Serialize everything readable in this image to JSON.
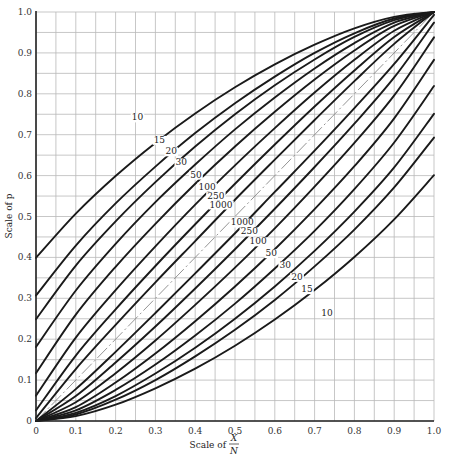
{
  "chart_data": {
    "type": "line",
    "title": "",
    "xlabel": "Scale of X/N",
    "xlabel_prefix": "Scale of",
    "xlabel_numerator": "X",
    "xlabel_denominator": "N",
    "ylabel": "Scale of p",
    "xlim": [
      0,
      1
    ],
    "ylim": [
      0,
      1
    ],
    "grid": true,
    "grid_step": 0.05,
    "x_ticks": [
      "0",
      "0.1",
      "0.2",
      "0.3",
      "0.4",
      "0.5",
      "0.6",
      "0.7",
      "0.8",
      "0.9",
      "1.0"
    ],
    "y_ticks": [
      "0",
      "0.1",
      "0.2",
      "0.3",
      "0.4",
      "0.5",
      "0.6",
      "0.7",
      "0.8",
      "0.9",
      "1.0"
    ],
    "reference_line": {
      "name": "diagonal p = X/N",
      "style": "dash-dot",
      "points": [
        [
          0,
          0
        ],
        [
          1,
          1
        ]
      ]
    },
    "x": [
      0,
      0.1,
      0.2,
      0.3,
      0.4,
      0.5,
      0.6,
      0.7,
      0.8,
      0.9,
      1.0
    ],
    "series": [
      {
        "name": "10",
        "band": "upper",
        "values": [
          0.399,
          0.507,
          0.599,
          0.68,
          0.752,
          0.816,
          0.872,
          0.92,
          0.96,
          0.988,
          1.0
        ]
      },
      {
        "name": "15",
        "band": "upper",
        "values": [
          0.307,
          0.429,
          0.532,
          0.622,
          0.704,
          0.777,
          0.842,
          0.9,
          0.948,
          0.984,
          1.0
        ]
      },
      {
        "name": "20",
        "band": "upper",
        "values": [
          0.249,
          0.38,
          0.488,
          0.584,
          0.671,
          0.75,
          0.821,
          0.884,
          0.939,
          0.98,
          1.0
        ]
      },
      {
        "name": "30",
        "band": "upper",
        "values": [
          0.181,
          0.319,
          0.433,
          0.535,
          0.627,
          0.713,
          0.791,
          0.862,
          0.924,
          0.974,
          1.0
        ]
      },
      {
        "name": "50",
        "band": "upper",
        "values": [
          0.117,
          0.26,
          0.377,
          0.482,
          0.58,
          0.671,
          0.756,
          0.835,
          0.906,
          0.966,
          1.0
        ]
      },
      {
        "name": "100",
        "band": "upper",
        "values": [
          0.062,
          0.204,
          0.32,
          0.427,
          0.529,
          0.625,
          0.716,
          0.803,
          0.883,
          0.954,
          1.0
        ]
      },
      {
        "name": "250",
        "band": "upper",
        "values": [
          0.026,
          0.16,
          0.273,
          0.379,
          0.481,
          0.58,
          0.676,
          0.769,
          0.857,
          0.939,
          1.0
        ]
      },
      {
        "name": "1000",
        "band": "upper",
        "values": [
          0.007,
          0.127,
          0.235,
          0.339,
          0.44,
          0.541,
          0.639,
          0.736,
          0.831,
          0.922,
          1.0
        ]
      },
      {
        "name": "10",
        "band": "lower",
        "values": [
          0.0,
          0.012,
          0.04,
          0.08,
          0.128,
          0.184,
          0.248,
          0.32,
          0.401,
          0.493,
          0.601
        ]
      },
      {
        "name": "15",
        "band": "lower",
        "values": [
          0.0,
          0.016,
          0.052,
          0.1,
          0.158,
          0.223,
          0.296,
          0.378,
          0.468,
          0.571,
          0.693
        ]
      },
      {
        "name": "20",
        "band": "lower",
        "values": [
          0.0,
          0.02,
          0.061,
          0.116,
          0.179,
          0.25,
          0.329,
          0.416,
          0.512,
          0.62,
          0.751
        ]
      },
      {
        "name": "30",
        "band": "lower",
        "values": [
          0.0,
          0.026,
          0.076,
          0.138,
          0.209,
          0.287,
          0.373,
          0.465,
          0.567,
          0.681,
          0.819
        ]
      },
      {
        "name": "50",
        "band": "lower",
        "values": [
          0.0,
          0.034,
          0.094,
          0.165,
          0.244,
          0.329,
          0.42,
          0.518,
          0.623,
          0.74,
          0.883
        ]
      },
      {
        "name": "100",
        "band": "lower",
        "values": [
          0.0,
          0.046,
          0.117,
          0.197,
          0.284,
          0.375,
          0.471,
          0.573,
          0.68,
          0.796,
          0.938
        ]
      },
      {
        "name": "250",
        "band": "lower",
        "values": [
          0.0,
          0.061,
          0.143,
          0.231,
          0.324,
          0.42,
          0.519,
          0.621,
          0.727,
          0.84,
          0.974
        ]
      },
      {
        "name": "1000",
        "band": "lower",
        "values": [
          0.0,
          0.078,
          0.169,
          0.264,
          0.361,
          0.459,
          0.56,
          0.661,
          0.765,
          0.873,
          0.993
        ]
      }
    ],
    "curve_labels": {
      "upper": [
        {
          "text": "10",
          "x": 0.255,
          "y": 0.735
        },
        {
          "text": "15",
          "x": 0.31,
          "y": 0.68
        },
        {
          "text": "20",
          "x": 0.34,
          "y": 0.652
        },
        {
          "text": "30",
          "x": 0.365,
          "y": 0.625
        },
        {
          "text": "50",
          "x": 0.402,
          "y": 0.595
        },
        {
          "text": "100",
          "x": 0.43,
          "y": 0.566
        },
        {
          "text": "250",
          "x": 0.452,
          "y": 0.544
        },
        {
          "text": "1000",
          "x": 0.465,
          "y": 0.522
        }
      ],
      "lower": [
        {
          "text": "1000",
          "x": 0.518,
          "y": 0.478
        },
        {
          "text": "250",
          "x": 0.536,
          "y": 0.456
        },
        {
          "text": "100",
          "x": 0.558,
          "y": 0.432
        },
        {
          "text": "50",
          "x": 0.591,
          "y": 0.403
        },
        {
          "text": "30",
          "x": 0.626,
          "y": 0.374
        },
        {
          "text": "20",
          "x": 0.656,
          "y": 0.345
        },
        {
          "text": "15",
          "x": 0.681,
          "y": 0.315
        },
        {
          "text": "10",
          "x": 0.731,
          "y": 0.256
        }
      ]
    }
  }
}
